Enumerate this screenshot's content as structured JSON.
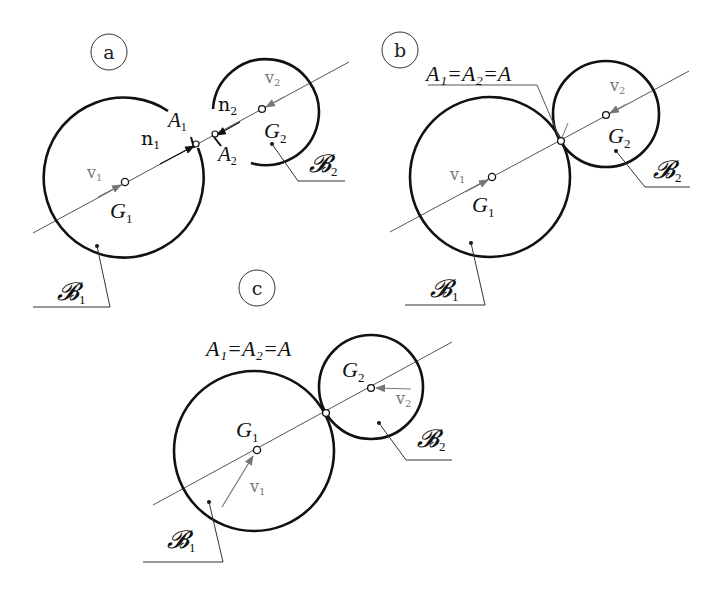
{
  "figure": {
    "colors": {
      "body_outline": "#111111",
      "line_of_centers": "#555555",
      "velocity_arrow": "#777777",
      "label_gray": "#777777",
      "text": "#111111"
    }
  },
  "panels": [
    {
      "id": "a",
      "label": "a",
      "body1": {
        "name": "𝓑",
        "sub": "1",
        "centroid": "G",
        "centroid_sub": "1",
        "velocity": "v",
        "velocity_sub": "1"
      },
      "body2": {
        "name": "𝓑",
        "sub": "2",
        "centroid": "G",
        "centroid_sub": "2",
        "velocity": "v",
        "velocity_sub": "2"
      },
      "contact1": {
        "label": "A",
        "sub": "1"
      },
      "contact2": {
        "label": "A",
        "sub": "2"
      },
      "normal1": {
        "label": "n",
        "sub": "1"
      },
      "normal2": {
        "label": "n",
        "sub": "2"
      }
    },
    {
      "id": "b",
      "label": "b",
      "body1": {
        "name": "𝓑",
        "sub": "1",
        "centroid": "G",
        "centroid_sub": "1",
        "velocity": "v",
        "velocity_sub": "1"
      },
      "body2": {
        "name": "𝓑",
        "sub": "2",
        "centroid": "G",
        "centroid_sub": "2",
        "velocity": "v",
        "velocity_sub": "2"
      },
      "contact_label": "A₁=A₂=A"
    },
    {
      "id": "c",
      "label": "c",
      "body1": {
        "name": "𝓑",
        "sub": "1",
        "centroid": "G",
        "centroid_sub": "1",
        "velocity": "v",
        "velocity_sub": "1"
      },
      "body2": {
        "name": "𝓑",
        "sub": "2",
        "centroid": "G",
        "centroid_sub": "2",
        "velocity": "v",
        "velocity_sub": "2"
      },
      "contact_label": "A₁=A₂=A"
    }
  ]
}
